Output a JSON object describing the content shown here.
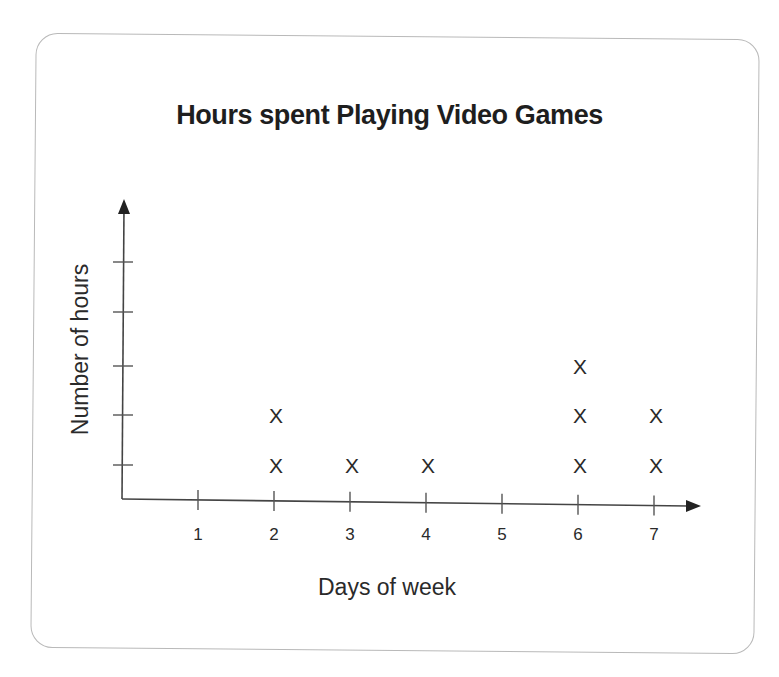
{
  "chart_data": {
    "type": "dot-plot",
    "title": "Hours spent Playing Video Games",
    "xlabel": "Days of week",
    "ylabel": "Number of hours",
    "categories": [
      "1",
      "2",
      "3",
      "4",
      "5",
      "6",
      "7"
    ],
    "values": [
      0,
      2,
      1,
      1,
      0,
      3,
      2
    ],
    "marker": "X",
    "y_ticks_count": 5,
    "y_tick_labels": [],
    "ylim": [
      0,
      5
    ],
    "grid": false,
    "legend": null
  },
  "chart": {
    "title": "Hours spent Playing Video Games",
    "x_axis_label": "Days of week",
    "y_axis_label": "Number of hours",
    "marker_glyph": "X",
    "x_tick_labels": [
      "1",
      "2",
      "3",
      "4",
      "5",
      "6",
      "7"
    ]
  },
  "colors": {
    "ink": "#2a2a2a",
    "card_border": "#b9b9b9",
    "background": "#ffffff"
  }
}
